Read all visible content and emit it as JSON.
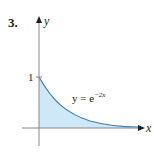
{
  "problem": {
    "number": "3."
  },
  "graph": {
    "x_axis_label": "x",
    "y_axis_label": "y",
    "y_tick_label": "1",
    "curve_label_base": "y = e",
    "curve_label_exponent": "−2x",
    "colors": {
      "fill": "#cfe8f7",
      "curve": "#3d7fb0",
      "axis": "#888888",
      "text": "#231f20"
    }
  }
}
